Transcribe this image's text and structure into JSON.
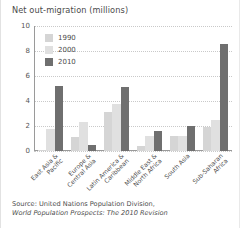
{
  "figure": {
    "title": "Net out-migration (millions)",
    "source_line1": "Source: United Nations Population Division,",
    "source_line2": "World Population Prospects: The 2010 Revision"
  },
  "legend": {
    "items": [
      {
        "label": "1990",
        "color": "#d5d5d5"
      },
      {
        "label": "2000",
        "color": "#e0e0e0"
      },
      {
        "label": "2010",
        "color": "#6f6f6f"
      }
    ]
  },
  "axes": {
    "yticks": [
      "0",
      "2",
      "4",
      "6",
      "8",
      "10"
    ],
    "ymin": 0,
    "ymax": 10
  },
  "chart_data": {
    "type": "bar",
    "title": "Net out-migration (millions)",
    "xlabel": "",
    "ylabel": "",
    "ylim": [
      0,
      10
    ],
    "ytick_values": [
      0,
      2,
      4,
      6,
      8,
      10
    ],
    "grid": true,
    "legend_position": "upper-left-inside",
    "categories": [
      "East Asia & Pacific",
      "Europe & Central Asia",
      "Latin America & Caribbean",
      "Middle East & North Africa",
      "South Asia",
      "Sub-Saharan Africa"
    ],
    "category_lines": [
      [
        "East Asia &",
        "Pacific"
      ],
      [
        "Europe &",
        "Central Asia"
      ],
      [
        "Latin America &",
        "Caribbean"
      ],
      [
        "Middle East &",
        "North Africa"
      ],
      [
        "South Asia"
      ],
      [
        "Sub-Saharan",
        "Africa"
      ]
    ],
    "series": [
      {
        "name": "1990",
        "color": "#d5d5d5",
        "values": [
          0.1,
          1.1,
          3.1,
          0.4,
          1.2,
          1.9
        ]
      },
      {
        "name": "2000",
        "color": "#e0e0e0",
        "values": [
          1.8,
          2.3,
          3.8,
          1.2,
          1.2,
          2.5
        ]
      },
      {
        "name": "2010",
        "color": "#6f6f6f",
        "values": [
          5.2,
          0.5,
          5.1,
          1.6,
          2.0,
          8.6
        ]
      }
    ]
  }
}
